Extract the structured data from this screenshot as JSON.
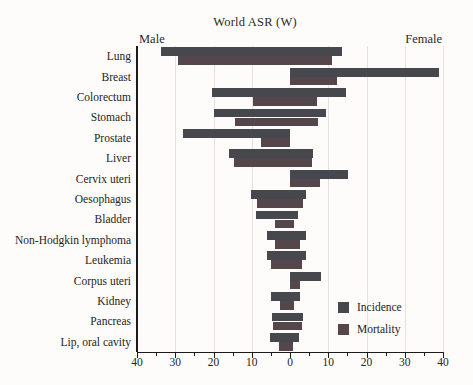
{
  "chart_data": {
    "type": "bar",
    "subtype": "diverging-horizontal-population-pyramid",
    "title": "World ASR (W)",
    "side_labels": {
      "left": "Male",
      "right": "Female"
    },
    "categories": [
      "Lung",
      "Breast",
      "Colorectum",
      "Stomach",
      "Prostate",
      "Liver",
      "Cervix uteri",
      "Oesophagus",
      "Bladder",
      "Non-Hodgkin lymphoma",
      "Leukemia",
      "Corpus uteri",
      "Kidney",
      "Pancreas",
      "Lip, oral cavity"
    ],
    "series": [
      {
        "name": "Incidence",
        "color": "#47484e",
        "male": [
          33.8,
          0,
          20.3,
          19.8,
          28.0,
          16.0,
          0,
          10.2,
          9.0,
          6.1,
          6.1,
          0,
          5.0,
          4.7,
          5.1
        ],
        "female": [
          13.5,
          38.9,
          14.6,
          9.5,
          0,
          6.0,
          15.2,
          4.2,
          2.2,
          4.1,
          4.1,
          8.0,
          2.7,
          3.3,
          2.4
        ]
      },
      {
        "name": "Mortality",
        "color": "#55464b",
        "male": [
          29.2,
          0,
          9.6,
          14.3,
          7.5,
          14.6,
          0,
          8.6,
          3.8,
          4.0,
          5.0,
          0,
          2.5,
          4.5,
          2.8
        ],
        "female": [
          11.0,
          12.4,
          7.0,
          7.4,
          0,
          5.7,
          7.8,
          3.4,
          1.1,
          2.5,
          3.2,
          2.5,
          1.1,
          3.2,
          0.9
        ]
      }
    ],
    "x_axis": {
      "ticks": [
        40,
        30,
        20,
        10,
        0,
        10,
        20,
        30,
        40
      ],
      "max_each_side": 40,
      "minor_tick_step": 5,
      "grid": true
    },
    "legend": {
      "position": "inside-bottom-right",
      "entries": [
        "Incidence",
        "Mortality"
      ]
    },
    "colors": {
      "axis": "#1b1b1b",
      "gridline": "#e7e1dd",
      "background": "#fdfcfa"
    }
  }
}
